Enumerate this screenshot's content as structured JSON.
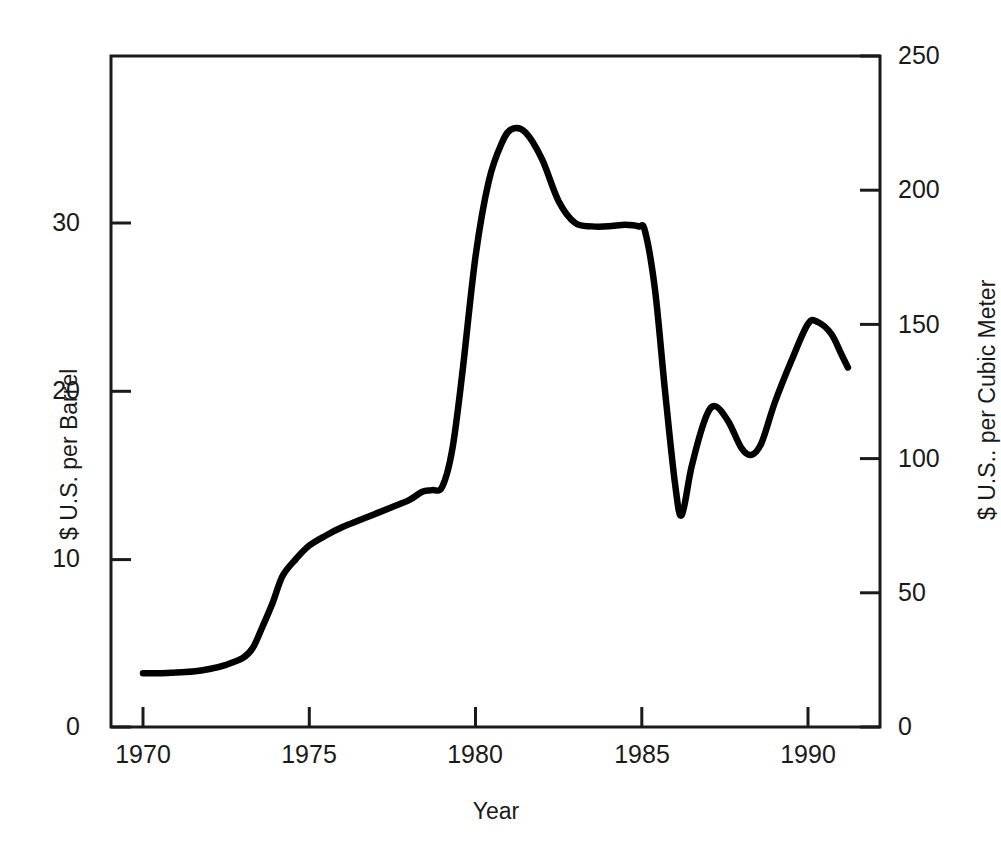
{
  "chart_data": {
    "type": "line",
    "title": "",
    "subtitle": "",
    "xlabel": "Year",
    "ylabel": "$ U.S. per Barrel",
    "y2label": "$ U.S.. per Cubic Meter",
    "xlim": [
      1969.0,
      1992.0
    ],
    "ylim": [
      0,
      39.6
    ],
    "y2lim": [
      0,
      250
    ],
    "grid": false,
    "legend": null,
    "legend_position": "none",
    "line_color": "#000000",
    "axis_color": "#1a1a1a",
    "background_color": "#ffffff",
    "xticks": [
      1970,
      1975,
      1980,
      1985,
      1990
    ],
    "xtick_labels": [
      "1970",
      "1975",
      "1980",
      "1985",
      "1990"
    ],
    "yticks": [
      0,
      10,
      20,
      30
    ],
    "ytick_labels": [
      "0",
      "10",
      "20",
      "30"
    ],
    "y2ticks": [
      0,
      50,
      100,
      150,
      200,
      250
    ],
    "y2tick_labels": [
      "0",
      "50",
      "100",
      "150",
      "200",
      "250"
    ],
    "series": [
      {
        "name": "Crude oil price",
        "x": [
          1970.0,
          1970.5,
          1971.0,
          1971.5,
          1972.0,
          1972.5,
          1973.0,
          1973.3,
          1973.6,
          1973.9,
          1974.2,
          1974.6,
          1975.0,
          1975.5,
          1976.0,
          1976.5,
          1977.0,
          1977.5,
          1978.0,
          1978.4,
          1978.7,
          1979.0,
          1979.3,
          1979.6,
          1980.0,
          1980.4,
          1980.8,
          1981.1,
          1981.5,
          1982.0,
          1982.5,
          1983.0,
          1983.5,
          1984.0,
          1984.5,
          1984.9,
          1985.1,
          1985.4,
          1985.7,
          1986.0,
          1986.2,
          1986.5,
          1986.9,
          1987.2,
          1987.6,
          1988.0,
          1988.3,
          1988.6,
          1989.0,
          1989.5,
          1990.0,
          1990.3,
          1990.7,
          1991.0,
          1991.2
        ],
        "y": [
          3.2,
          3.2,
          3.25,
          3.3,
          3.45,
          3.7,
          4.1,
          4.7,
          6.0,
          7.4,
          9.0,
          10.0,
          10.8,
          11.4,
          11.9,
          12.3,
          12.7,
          13.1,
          13.5,
          14.0,
          14.1,
          14.3,
          16.5,
          21.0,
          28.0,
          32.5,
          34.8,
          35.6,
          35.4,
          33.8,
          31.3,
          30.0,
          29.8,
          29.8,
          29.9,
          29.8,
          29.5,
          26.0,
          20.0,
          14.5,
          12.6,
          15.5,
          18.3,
          19.1,
          18.2,
          16.6,
          16.2,
          16.9,
          19.3,
          21.8,
          24.0,
          24.1,
          23.4,
          22.2,
          21.4
        ]
      }
    ],
    "annotations": [
      {
        "text": "1979-1981 oil price spike peak",
        "value": 35.6
      },
      {
        "text": "1986 price collapse trough",
        "value": 12.6
      }
    ]
  },
  "axes": {
    "x_title": "Year",
    "y_left_title": "$ U.S. per Barrel",
    "y_right_title": "$ U.S.. per Cubic Meter"
  }
}
